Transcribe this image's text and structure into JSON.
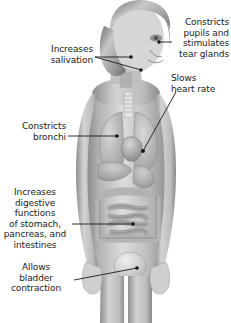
{
  "figure": {
    "background_color": "#ffffff",
    "label_color": "#1b1b1b",
    "leader_line_color": "#1a1a1a"
  },
  "labels": {
    "pupils": "Constricts\npupils and\nstimulates\ntear glands",
    "salivation": "Increases\nsalivation",
    "heart": "Slows\nheart rate",
    "bronchi": "Constricts\nbronchi",
    "digestive": "Increases\ndigestive\nfunctions\nof stomach,\npancreas, and\nintestines",
    "bladder": "Allows\nbladder\ncontraction"
  },
  "callouts": [
    {
      "name": "pupils-and-tear-glands",
      "target_x": 158,
      "target_y": 42
    },
    {
      "name": "salivation-upper",
      "target_x": 131,
      "target_y": 57
    },
    {
      "name": "salivation-lower",
      "target_x": 141,
      "target_y": 70
    },
    {
      "name": "heart",
      "target_x": 142,
      "target_y": 152
    },
    {
      "name": "bronchi",
      "target_x": 117,
      "target_y": 136
    },
    {
      "name": "digestive-organs",
      "target_x": 133,
      "target_y": 224
    },
    {
      "name": "bladder",
      "target_x": 137,
      "target_y": 267
    }
  ]
}
